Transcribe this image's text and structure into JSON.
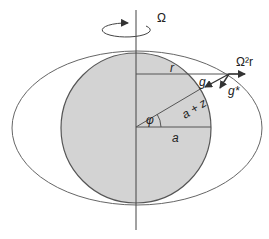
{
  "diagram": {
    "labels": {
      "omega": "Ω",
      "r": "r",
      "centrifugal": "Ω²r",
      "g_ell": "g",
      "g_ell_sub": "E",
      "g_star": "g*",
      "radius_vector": "a + z",
      "latitude": "φ",
      "equatorial_radius": "a"
    },
    "colors": {
      "sphere_fill": "#d3d3d3",
      "stroke": "#555555"
    }
  }
}
